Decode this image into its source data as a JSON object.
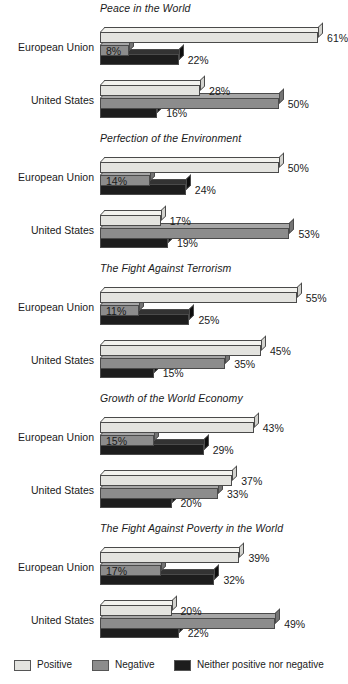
{
  "chart_data": {
    "type": "bar",
    "orientation": "horizontal",
    "title": "",
    "xlabel": "",
    "ylabel": "",
    "xlim": [
      0,
      65
    ],
    "grid": false,
    "legend_position": "bottom",
    "series_names": [
      "Positive",
      "Negative",
      "Neither positive nor negative"
    ],
    "series_colors": [
      "#e3e3df",
      "#8c8c8c",
      "#1d1d1d"
    ],
    "categories": [
      "European Union",
      "United States"
    ],
    "value_suffix": "%",
    "panels": [
      {
        "title": "Peace in the World",
        "groups": [
          {
            "label": "European Union",
            "values": [
              61,
              8,
              22
            ],
            "labels": [
              "61%",
              "8%",
              "22%"
            ]
          },
          {
            "label": "United States",
            "values": [
              28,
              50,
              16
            ],
            "labels": [
              "28%",
              "50%",
              "16%"
            ]
          }
        ]
      },
      {
        "title": "Perfection of the Environment",
        "groups": [
          {
            "label": "European Union",
            "values": [
              50,
              14,
              24
            ],
            "labels": [
              "50%",
              "14%",
              "24%"
            ]
          },
          {
            "label": "United States",
            "values": [
              17,
              53,
              19
            ],
            "labels": [
              "17%",
              "53%",
              "19%"
            ]
          }
        ]
      },
      {
        "title": "The Fight Against Terrorism",
        "groups": [
          {
            "label": "European Union",
            "values": [
              55,
              11,
              25
            ],
            "labels": [
              "55%",
              "11%",
              "25%"
            ]
          },
          {
            "label": "United States",
            "values": [
              45,
              35,
              15
            ],
            "labels": [
              "45%",
              "35%",
              "15%"
            ]
          }
        ]
      },
      {
        "title": "Growth of the World Economy",
        "groups": [
          {
            "label": "European Union",
            "values": [
              43,
              15,
              29
            ],
            "labels": [
              "43%",
              "15%",
              "29%"
            ]
          },
          {
            "label": "United States",
            "values": [
              37,
              33,
              20
            ],
            "labels": [
              "37%",
              "33%",
              "20%"
            ]
          }
        ]
      },
      {
        "title": "The Fight Against Poverty in the World",
        "groups": [
          {
            "label": "European Union",
            "values": [
              39,
              17,
              32
            ],
            "labels": [
              "39%",
              "17%",
              "32%"
            ]
          },
          {
            "label": "United States",
            "values": [
              20,
              49,
              22
            ],
            "labels": [
              "20%",
              "49%",
              "22%"
            ]
          }
        ]
      }
    ],
    "legend": [
      {
        "label": "Positive",
        "color": "#e3e3df"
      },
      {
        "label": "Negative",
        "color": "#8c8c8c"
      },
      {
        "label": "Neither positive nor negative",
        "color": "#1d1d1d"
      }
    ]
  }
}
